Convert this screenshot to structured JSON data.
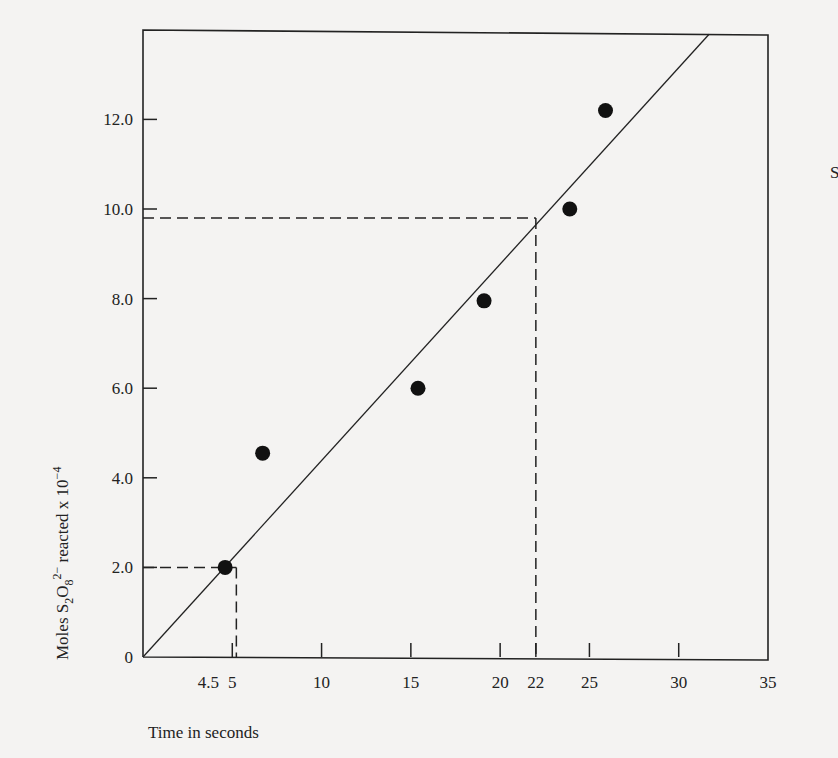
{
  "chart_data": {
    "type": "scatter",
    "title": "",
    "xlabel": "Time in seconds",
    "ylabel": "Moles S2O8 2- reacted x 10-4",
    "ylabel_parts": {
      "pre": "Moles S",
      "sub1": "2",
      "mid": "O",
      "sub2": "8",
      "sup": "2−",
      "post": " reacted x 10",
      "exp": "−4"
    },
    "xlim": [
      0,
      35
    ],
    "ylim": [
      0,
      14
    ],
    "grid": false,
    "legend": null,
    "x_ticks": [
      {
        "value": 5,
        "label": "5"
      },
      {
        "value": 10,
        "label": "10"
      },
      {
        "value": 15,
        "label": "15"
      },
      {
        "value": 20,
        "label": "20"
      },
      {
        "value": 22,
        "label": "22"
      },
      {
        "value": 25,
        "label": "25"
      },
      {
        "value": 30,
        "label": "30"
      },
      {
        "value": 35,
        "label": "35"
      }
    ],
    "x_extra_labels": [
      {
        "value": 4.5,
        "label": "4.5"
      }
    ],
    "y_ticks": [
      {
        "value": 0,
        "label": "0"
      },
      {
        "value": 2,
        "label": "2.0"
      },
      {
        "value": 4,
        "label": "4.0"
      },
      {
        "value": 6,
        "label": "6.0"
      },
      {
        "value": 8,
        "label": "8.0"
      },
      {
        "value": 10,
        "label": "10.0"
      },
      {
        "value": 12,
        "label": "12.0"
      }
    ],
    "series": [
      {
        "name": "measured",
        "type": "scatter",
        "points": [
          {
            "x": 4.6,
            "y": 2.0
          },
          {
            "x": 6.7,
            "y": 4.55
          },
          {
            "x": 15.4,
            "y": 6.0
          },
          {
            "x": 19.1,
            "y": 7.95
          },
          {
            "x": 23.9,
            "y": 10.0
          },
          {
            "x": 25.9,
            "y": 12.2
          }
        ]
      },
      {
        "name": "best-fit line",
        "type": "line",
        "points": [
          {
            "x": 0,
            "y": 0
          },
          {
            "x": 31.7,
            "y": 13.9
          }
        ]
      }
    ],
    "annotations": [
      {
        "type": "dashed-guide",
        "x": 4.5,
        "y": 2.0,
        "label": "4.5"
      },
      {
        "type": "dashed-guide",
        "x": 22,
        "y": 9.8,
        "label": "22"
      }
    ]
  },
  "stray_text": "S",
  "colors": {
    "background": "#f4f3f2",
    "ink": "#222222"
  }
}
